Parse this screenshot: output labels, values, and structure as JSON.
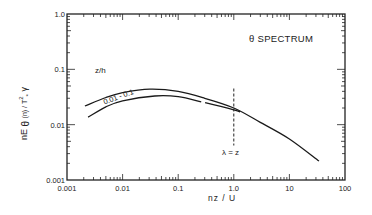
{
  "chart_data": {
    "type": "line",
    "title": "θ SPECTRUM",
    "xlabel": "nz / U",
    "ylabel": "nE θ (n) / T*² γ",
    "xscale": "log",
    "yscale": "log",
    "xlim": [
      0.001,
      100
    ],
    "ylim": [
      0.001,
      1.0
    ],
    "grid": false,
    "x_ticks": [
      "0.001",
      "0.01",
      "0.1",
      "1.0",
      "10",
      "100"
    ],
    "y_ticks": [
      "0.001",
      "0.01",
      "0.1",
      "1.0"
    ],
    "series": [
      {
        "name": "z/h = 0.01 (upper bound)",
        "x": [
          0.0021,
          0.005,
          0.01,
          0.031,
          0.1,
          0.3,
          1.0,
          3.0,
          10,
          34
        ],
        "y": [
          0.0217,
          0.031,
          0.038,
          0.044,
          0.04,
          0.03,
          0.02,
          0.011,
          0.0055,
          0.0022
        ]
      },
      {
        "name": "z/h = 0.1 (lower bound)",
        "x": [
          0.0024,
          0.005,
          0.01,
          0.038,
          0.1,
          0.3,
          1.0,
          1.3
        ],
        "y": [
          0.0137,
          0.021,
          0.027,
          0.033,
          0.032,
          0.025,
          0.0185,
          0.017
        ]
      }
    ],
    "annotations": [
      {
        "text": "z/h",
        "x": 0.0055,
        "y": 0.083
      },
      {
        "text": "0.01 - 0.1",
        "x": 0.004,
        "y": 0.025,
        "note": "label between curves"
      },
      {
        "text": "λ = z",
        "x": 1.0,
        "y": 0.0032,
        "note": "below vertical dashed line at nz/U = 1.0"
      }
    ],
    "reference_lines": [
      {
        "type": "vertical",
        "x": 1.0,
        "style": "dashed",
        "y_range": [
          0.0042,
          0.045
        ]
      }
    ]
  },
  "labels": {
    "title": "θ SPECTRUM",
    "xlabel": "nz / U",
    "ylabel_main": "nE",
    "ylabel_sub": "θ",
    "ylabel_rest": "(n) / T",
    "ylabel_sup": "2",
    "ylabel_sub2": "*",
    "ylabel_end": "γ",
    "zh": "z/h",
    "range": "0.01 - 0.1",
    "lambda": "λ = z"
  }
}
